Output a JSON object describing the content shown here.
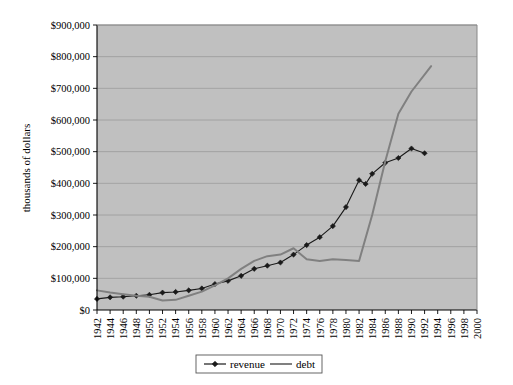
{
  "chart_data": {
    "type": "line",
    "title": "",
    "xlabel": "",
    "ylabel": "thousands of dollars",
    "xlim": [
      1942,
      2000
    ],
    "ylim": [
      0,
      900000
    ],
    "grid": true,
    "legend_position": "bottom",
    "plot_background": "#c0c0c0",
    "y_ticks": [
      0,
      100000,
      200000,
      300000,
      400000,
      500000,
      600000,
      700000,
      800000,
      900000
    ],
    "y_tick_labels": [
      "$0",
      "$100,000",
      "$200,000",
      "$300,000",
      "$400,000",
      "$500,000",
      "$600,000",
      "$700,000",
      "$800,000",
      "$900,000"
    ],
    "x_ticks": [
      1942,
      1944,
      1946,
      1948,
      1950,
      1952,
      1954,
      1956,
      1958,
      1960,
      1962,
      1964,
      1966,
      1968,
      1970,
      1972,
      1974,
      1976,
      1978,
      1980,
      1982,
      1984,
      1986,
      1988,
      1990,
      1992,
      1994,
      1996,
      1998,
      2000
    ],
    "x_tick_labels": [
      "1942",
      "1944",
      "1946",
      "1948",
      "1950",
      "1952",
      "1954",
      "1956",
      "1958",
      "1960",
      "1962",
      "1964",
      "1966",
      "1968",
      "1970",
      "1972",
      "1974",
      "1976",
      "1978",
      "1980",
      "1982",
      "1984",
      "1986",
      "1988",
      "1990",
      "1992",
      "1994",
      "1996",
      "1998",
      "2000"
    ],
    "series": [
      {
        "name": "revenue",
        "color": "#1a1a1a",
        "marker": "diamond",
        "x": [
          1942,
          1944,
          1946,
          1948,
          1950,
          1952,
          1954,
          1956,
          1958,
          1960,
          1962,
          1964,
          1966,
          1968,
          1970,
          1972,
          1974,
          1976,
          1978,
          1980,
          1982,
          1983,
          1984,
          1986,
          1988,
          1990,
          1992
        ],
        "values": [
          35000,
          40000,
          42000,
          45000,
          48000,
          55000,
          57000,
          62000,
          68000,
          82000,
          92000,
          108000,
          130000,
          140000,
          150000,
          175000,
          205000,
          230000,
          265000,
          325000,
          410000,
          398000,
          430000,
          465000,
          480000,
          510000,
          495000
        ]
      },
      {
        "name": "debt",
        "color": "#808080",
        "marker": "none",
        "x": [
          1942,
          1944,
          1946,
          1948,
          1950,
          1952,
          1954,
          1956,
          1958,
          1960,
          1962,
          1964,
          1966,
          1968,
          1970,
          1972,
          1974,
          1976,
          1978,
          1980,
          1982,
          1984,
          1986,
          1988,
          1990,
          1993
        ],
        "values": [
          62000,
          55000,
          50000,
          45000,
          42000,
          30000,
          32000,
          45000,
          58000,
          78000,
          100000,
          130000,
          155000,
          170000,
          175000,
          195000,
          160000,
          155000,
          160000,
          158000,
          155000,
          300000,
          470000,
          620000,
          690000,
          770000
        ]
      }
    ],
    "annotations": [
      "revenue and debt cross near 1972",
      "debt plateaus near $155,000 from 1974 to 1982",
      "debt rises steeply after 1982 and overtakes revenue near 1987"
    ]
  },
  "legend": {
    "items": [
      {
        "label": "revenue"
      },
      {
        "label": "debt"
      }
    ]
  }
}
